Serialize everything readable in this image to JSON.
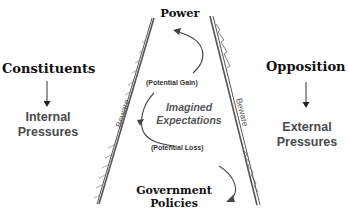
{
  "diagram": {
    "top_label": "Power",
    "bottom_label_line1": "Government",
    "bottom_label_line2": "Policies",
    "center_label_line1": "Imagined",
    "center_label_line2": "Expectations",
    "gain_label": "(Potential Gain)",
    "loss_label": "(Potential Loss)",
    "left_wall_label": "Beware",
    "right_wall_label": "Beware",
    "left": {
      "title": "Constituents",
      "pressure_line1": "Internal",
      "pressure_line2": "Pressures"
    },
    "right": {
      "title": "Opposition",
      "pressure_line1": "External",
      "pressure_line2": "Pressures"
    }
  }
}
